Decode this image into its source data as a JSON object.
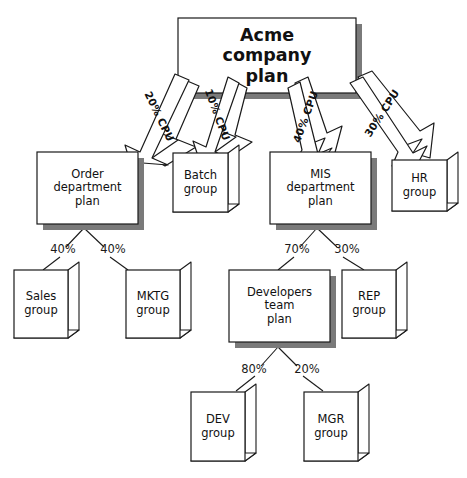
{
  "diagram": {
    "title_node": {
      "label": "Acme\ncompany\nplan"
    },
    "nodes": [
      {
        "id": "acme",
        "label": "Acme\ncompany\nplan",
        "kind": "plan",
        "level": 0
      },
      {
        "id": "order",
        "label": "Order\ndepartment\nplan",
        "kind": "plan",
        "level": 1
      },
      {
        "id": "batch",
        "label": "Batch\ngroup",
        "kind": "group",
        "level": 1
      },
      {
        "id": "mis",
        "label": "MIS\ndepartment\nplan",
        "kind": "plan",
        "level": 1
      },
      {
        "id": "hr",
        "label": "HR\ngroup",
        "kind": "group",
        "level": 1
      },
      {
        "id": "sales",
        "label": "Sales\ngroup",
        "kind": "group",
        "level": 2
      },
      {
        "id": "mktg",
        "label": "MKTG\ngroup",
        "kind": "group",
        "level": 2
      },
      {
        "id": "devteam",
        "label": "Developers\nteam\nplan",
        "kind": "plan",
        "level": 2
      },
      {
        "id": "rep",
        "label": "REP\ngroup",
        "kind": "group",
        "level": 2
      },
      {
        "id": "dev",
        "label": "DEV\ngroup",
        "kind": "group",
        "level": 3
      },
      {
        "id": "mgr",
        "label": "MGR\ngroup",
        "kind": "group",
        "level": 3
      }
    ],
    "arrow_edges": [
      {
        "from": "acme",
        "to": "order",
        "label": "20% CPU"
      },
      {
        "from": "acme",
        "to": "batch",
        "label": "10% CPU"
      },
      {
        "from": "acme",
        "to": "mis",
        "label": "40% CPU"
      },
      {
        "from": "acme",
        "to": "hr",
        "label": "30% CPU"
      }
    ],
    "line_edges": [
      {
        "from": "order",
        "to": "sales",
        "label": "40%"
      },
      {
        "from": "order",
        "to": "mktg",
        "label": "40%"
      },
      {
        "from": "mis",
        "to": "devteam",
        "label": "70%"
      },
      {
        "from": "mis",
        "to": "rep",
        "label": "30%"
      },
      {
        "from": "devteam",
        "to": "dev",
        "label": "80%"
      },
      {
        "from": "devteam",
        "to": "mgr",
        "label": "20%"
      }
    ],
    "colors": {
      "background": "#ffffff",
      "stroke": "#1a1a1a",
      "shadow": "#808080",
      "fill": "#ffffff",
      "text": "#111111"
    }
  }
}
